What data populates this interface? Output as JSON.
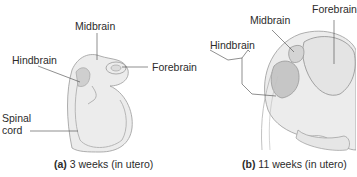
{
  "figure": {
    "panel_a": {
      "letter": "(a)",
      "caption": "3 weeks (in utero)",
      "labels": {
        "midbrain": "Midbrain",
        "hindbrain": "Hindbrain",
        "forebrain": "Forebrain",
        "spinal_cord_line1": "Spinal",
        "spinal_cord_line2": "cord"
      }
    },
    "panel_b": {
      "letter": "(b)",
      "caption": "11 weeks (in utero)",
      "labels": {
        "forebrain": "Forebrain",
        "midbrain": "Midbrain",
        "hindbrain": "Hindbrain"
      }
    },
    "colors": {
      "background": "#ffffff",
      "text": "#2b2b2b",
      "illustration_fill": "#e9e9e9",
      "illustration_shade": "#cfcfcf",
      "outline": "#9a9a9a"
    }
  }
}
